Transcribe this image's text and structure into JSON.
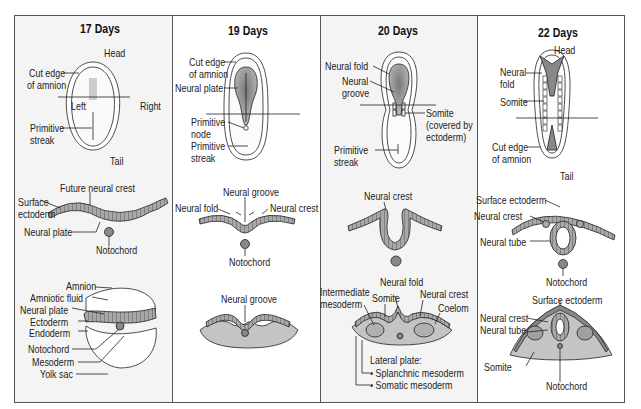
{
  "panels": [
    {
      "title": "17 Days",
      "dorsal": {
        "head": "Head",
        "tail": "Tail",
        "cut_edge_1": "Cut edge",
        "cut_edge_2": "of amnion",
        "left": "Left",
        "right": "Right",
        "primitive_streak_1": "Primitive",
        "primitive_streak_2": "streak"
      },
      "section1": {
        "future_neural_crest": "Future neural crest",
        "surface_ectoderm_1": "Surface",
        "surface_ectoderm_2": "ectoderm",
        "neural_plate": "Neural plate",
        "notochord": "Notochord"
      },
      "section2": {
        "amnion": "Amnion",
        "amniotic_fluid": "Amniotic fluid",
        "neural_plate": "Neural plate",
        "ectoderm": "Ectoderm",
        "endoderm": "Endoderm",
        "notochord": "Notochord",
        "mesoderm": "Mesoderm",
        "yolk_sac": "Yolk sac"
      }
    },
    {
      "title": "19 Days",
      "dorsal": {
        "cut_edge_1": "Cut edge",
        "cut_edge_2": "of amnion",
        "neural_plate": "Neural plate",
        "primitive_node_1": "Primitive",
        "primitive_node_2": "node",
        "primitive_streak_1": "Primitive",
        "primitive_streak_2": "streak"
      },
      "section1": {
        "neural_groove": "Neural groove",
        "neural_fold": "Neural fold",
        "neural_crest": "Neural crest",
        "notochord": "Notochord"
      },
      "section2": {
        "neural_groove": "Neural groove"
      }
    },
    {
      "title": "20 Days",
      "dorsal": {
        "neural_fold": "Neural fold",
        "neural_groove_1": "Neural",
        "neural_groove_2": "groove",
        "somite_1": "Somite",
        "somite_2": "(covered by",
        "somite_3": "ectoderm)",
        "primitive_streak_1": "Primitive",
        "primitive_streak_2": "streak"
      },
      "section1": {
        "neural_crest": "Neural crest"
      },
      "section2": {
        "intermediate_mesoderm_1": "Intermediate",
        "intermediate_mesoderm_2": "mesoderm",
        "somite": "Somite",
        "neural_fold": "Neural fold",
        "neural_crest": "Neural crest",
        "coelom": "Coelom",
        "lateral_plate": "Lateral plate:",
        "splanchnic": "• Splanchnic mesoderm",
        "somatic": "• Somatic mesoderm"
      }
    },
    {
      "title": "22 Days",
      "dorsal": {
        "head": "Head",
        "tail": "Tail",
        "neural_fold_1": "Neural",
        "neural_fold_2": "fold",
        "somite": "Somite",
        "cut_edge_1": "Cut edge",
        "cut_edge_2": "of amnion"
      },
      "section1": {
        "surface_ectoderm": "Surface ectoderm",
        "neural_crest": "Neural crest",
        "neural_tube": "Neural tube",
        "notochord": "Notochord"
      },
      "section2": {
        "surface_ectoderm": "Surface ectoderm",
        "neural_crest": "Neural crest",
        "neural_tube": "Neural tube",
        "somite": "Somite",
        "notochord": "Notochord"
      }
    }
  ],
  "colors": {
    "panel_shade": "#f4f4f4",
    "tissue_gray": "#8f8f8f",
    "mesoderm_gray": "#b8b8b8",
    "notochord": "#888888",
    "line": "#222222"
  }
}
